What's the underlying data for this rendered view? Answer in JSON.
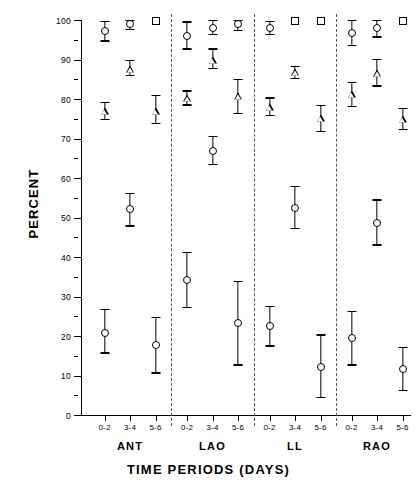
{
  "chart_data": {
    "type": "scatter",
    "title": "",
    "xlabel": "TIME PERIODS (DAYS)",
    "ylabel": "PERCENT",
    "ylim": [
      0,
      100
    ],
    "ytick_labels": [
      "0",
      "10",
      "20",
      "30",
      "40",
      "50",
      "60",
      "70",
      "80",
      "90",
      "100"
    ],
    "ytick_values": [
      0,
      10,
      20,
      30,
      40,
      50,
      60,
      70,
      80,
      90,
      100
    ],
    "minor_tick_step": 5,
    "grid": false,
    "legend": "none",
    "error_bars": "vertical, capped (mean +/- error)",
    "groups": [
      "ANT",
      "LAO",
      "LL",
      "RAO"
    ],
    "categories": [
      "0-2",
      "3-4",
      "5-6"
    ],
    "marker_shapes": [
      "square",
      "circle",
      "triangle",
      "circle"
    ],
    "series": [
      {
        "name": "Series A",
        "marker": "square",
        "points": [
          {
            "group": "ANT",
            "period": "0-2",
            "value": null,
            "low": null,
            "high": null
          },
          {
            "group": "ANT",
            "period": "3-4",
            "value": null,
            "low": null,
            "high": null
          },
          {
            "group": "ANT",
            "period": "5-6",
            "value": 100,
            "low": 100,
            "high": 100
          },
          {
            "group": "LAO",
            "period": "0-2",
            "value": null,
            "low": null,
            "high": null
          },
          {
            "group": "LAO",
            "period": "3-4",
            "value": null,
            "low": null,
            "high": null
          },
          {
            "group": "LAO",
            "period": "5-6",
            "value": null,
            "low": null,
            "high": null
          },
          {
            "group": "LL",
            "period": "0-2",
            "value": null,
            "low": null,
            "high": null
          },
          {
            "group": "LL",
            "period": "3-4",
            "value": 100,
            "low": 100,
            "high": 100
          },
          {
            "group": "LL",
            "period": "5-6",
            "value": 100,
            "low": 100,
            "high": 100
          },
          {
            "group": "RAO",
            "period": "0-2",
            "value": null,
            "low": null,
            "high": null
          },
          {
            "group": "RAO",
            "period": "3-4",
            "value": null,
            "low": null,
            "high": null
          },
          {
            "group": "RAO",
            "period": "5-6",
            "value": 100,
            "low": 100,
            "high": 100
          }
        ]
      },
      {
        "name": "Series B",
        "marker": "circle",
        "points": [
          {
            "group": "ANT",
            "period": "0-2",
            "value": 97.3,
            "low": 94.8,
            "high": 99.8
          },
          {
            "group": "ANT",
            "period": "3-4",
            "value": 99.0,
            "low": 97.8,
            "high": 100
          },
          {
            "group": "ANT",
            "period": "5-6",
            "value": null,
            "low": null,
            "high": null
          },
          {
            "group": "LAO",
            "period": "0-2",
            "value": 96.0,
            "low": 92.8,
            "high": 99.6
          },
          {
            "group": "LAO",
            "period": "3-4",
            "value": 98.2,
            "low": 96.5,
            "high": 100
          },
          {
            "group": "LAO",
            "period": "5-6",
            "value": 99.0,
            "low": 97.5,
            "high": 100
          },
          {
            "group": "LL",
            "period": "0-2",
            "value": 98.1,
            "low": 96.5,
            "high": 99.8
          },
          {
            "group": "LL",
            "period": "3-4",
            "value": null,
            "low": null,
            "high": null
          },
          {
            "group": "LL",
            "period": "5-6",
            "value": null,
            "low": null,
            "high": null
          },
          {
            "group": "RAO",
            "period": "0-2",
            "value": 96.8,
            "low": 93.6,
            "high": 100
          },
          {
            "group": "RAO",
            "period": "3-4",
            "value": 98.0,
            "low": 95.8,
            "high": 100
          },
          {
            "group": "RAO",
            "period": "5-6",
            "value": null,
            "low": null,
            "high": null
          }
        ]
      },
      {
        "name": "Series C",
        "marker": "triangle",
        "points": [
          {
            "group": "ANT",
            "period": "0-2",
            "value": 77.0,
            "low": 75.0,
            "high": 79.3
          },
          {
            "group": "ANT",
            "period": "3-4",
            "value": 87.8,
            "low": 86.0,
            "high": 89.8
          },
          {
            "group": "ANT",
            "period": "5-6",
            "value": 77.0,
            "low": 74.0,
            "high": 81.0
          },
          {
            "group": "LAO",
            "period": "0-2",
            "value": 80.3,
            "low": 78.6,
            "high": 82.2
          },
          {
            "group": "LAO",
            "period": "3-4",
            "value": 90.0,
            "low": 87.8,
            "high": 92.8
          },
          {
            "group": "LAO",
            "period": "5-6",
            "value": 80.8,
            "low": 76.5,
            "high": 85.0
          },
          {
            "group": "LL",
            "period": "0-2",
            "value": 78.0,
            "low": 76.0,
            "high": 80.4
          },
          {
            "group": "LL",
            "period": "3-4",
            "value": 87.0,
            "low": 85.4,
            "high": 88.4
          },
          {
            "group": "LL",
            "period": "5-6",
            "value": 75.2,
            "low": 72.0,
            "high": 78.5
          },
          {
            "group": "RAO",
            "period": "0-2",
            "value": 81.3,
            "low": 78.2,
            "high": 84.3
          },
          {
            "group": "RAO",
            "period": "3-4",
            "value": 86.8,
            "low": 83.4,
            "high": 90.2
          },
          {
            "group": "RAO",
            "period": "5-6",
            "value": 75.0,
            "low": 72.4,
            "high": 77.8
          }
        ]
      },
      {
        "name": "Series D",
        "marker": "circle",
        "points": [
          {
            "group": "ANT",
            "period": "0-2",
            "value": 21.0,
            "low": 15.8,
            "high": 26.8
          },
          {
            "group": "ANT",
            "period": "3-4",
            "value": 52.2,
            "low": 48.0,
            "high": 56.2
          },
          {
            "group": "ANT",
            "period": "5-6",
            "value": 17.8,
            "low": 10.8,
            "high": 24.8
          },
          {
            "group": "LAO",
            "period": "0-2",
            "value": 34.3,
            "low": 27.4,
            "high": 41.2
          },
          {
            "group": "LAO",
            "period": "3-4",
            "value": 67.0,
            "low": 63.6,
            "high": 70.6
          },
          {
            "group": "LAO",
            "period": "5-6",
            "value": 23.4,
            "low": 12.8,
            "high": 34.0
          },
          {
            "group": "LL",
            "period": "0-2",
            "value": 22.6,
            "low": 17.6,
            "high": 27.6
          },
          {
            "group": "LL",
            "period": "3-4",
            "value": 52.6,
            "low": 47.4,
            "high": 58.0
          },
          {
            "group": "LL",
            "period": "5-6",
            "value": 12.4,
            "low": 4.6,
            "high": 20.4
          },
          {
            "group": "RAO",
            "period": "0-2",
            "value": 19.6,
            "low": 12.8,
            "high": 26.4
          },
          {
            "group": "RAO",
            "period": "3-4",
            "value": 48.8,
            "low": 43.2,
            "high": 54.6
          },
          {
            "group": "RAO",
            "period": "5-6",
            "value": 11.8,
            "low": 6.4,
            "high": 17.2
          }
        ]
      }
    ]
  }
}
